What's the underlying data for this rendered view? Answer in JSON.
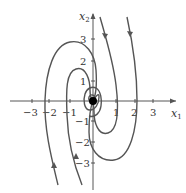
{
  "diagram": {
    "type": "phase-portrait",
    "x_axis": {
      "label": "x",
      "subscript": "1",
      "ticks": [
        "−3",
        "−2",
        "−1",
        "1",
        "2",
        "3"
      ]
    },
    "y_axis": {
      "label": "x",
      "subscript": "2",
      "ticks": [
        "3",
        "2",
        "1",
        "−1",
        "−2",
        "−3"
      ]
    },
    "equilibrium": {
      "x": 0,
      "y": 0,
      "type": "stable spiral"
    },
    "colors": {
      "curve": "#555555",
      "axis": "#444444",
      "equilibrium": "#000000"
    }
  }
}
